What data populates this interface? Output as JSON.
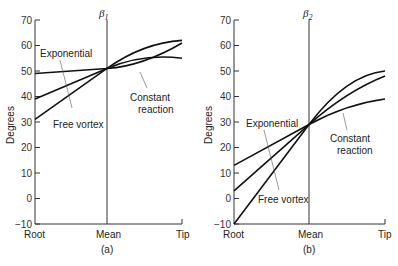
{
  "chart_data": [
    {
      "type": "line",
      "panel_label": "(a)",
      "title": "β1",
      "ylabel": "Degrees",
      "xlabel": "",
      "x": [
        "Root",
        "Mean",
        "Tip"
      ],
      "ylim": [
        -10,
        70
      ],
      "yticks": [
        -10,
        0,
        10,
        20,
        30,
        40,
        50,
        60,
        70
      ],
      "grid": false,
      "series": [
        {
          "name": "Exponential",
          "values": [
            49,
            51,
            61
          ]
        },
        {
          "name": "Free vortex",
          "values": [
            31,
            51,
            62
          ]
        },
        {
          "name": "Constant reaction",
          "values": [
            39,
            51,
            55
          ]
        }
      ],
      "annotations": [
        "Exponential",
        "Free vortex",
        "Constant reaction"
      ]
    },
    {
      "type": "line",
      "panel_label": "(b)",
      "title": "β2",
      "ylabel": "Degrees",
      "xlabel": "",
      "x": [
        "Root",
        "Mean",
        "Tip"
      ],
      "ylim": [
        -10,
        70
      ],
      "yticks": [
        -10,
        0,
        10,
        20,
        30,
        40,
        50,
        60,
        70
      ],
      "grid": false,
      "series": [
        {
          "name": "Exponential",
          "values": [
            3,
            29,
            48
          ]
        },
        {
          "name": "Free vortex",
          "values": [
            -10,
            29,
            50
          ]
        },
        {
          "name": "Constant reaction",
          "values": [
            13,
            29,
            39
          ]
        }
      ],
      "annotations": [
        "Exponential",
        "Free vortex",
        "Constant reaction"
      ]
    }
  ],
  "labels": {
    "a": {
      "beta_main": "β",
      "beta_sub": "1",
      "ylabel": "Degrees",
      "x_root": "Root",
      "x_mean": "Mean",
      "x_tip": "Tip",
      "panel": "(a)",
      "exponential": "Exponential",
      "free_vortex": "Free vortex",
      "constant_1": "Constant",
      "constant_2": "reaction"
    },
    "b": {
      "beta_main": "β",
      "beta_sub": "2",
      "ylabel": "Degrees",
      "x_root": "Root",
      "x_mean": "Mean",
      "x_tip": "Tip",
      "panel": "(b)",
      "exponential": "Exponential",
      "free_vortex": "Free vortex",
      "constant_1": "Constant",
      "constant_2": "reaction"
    }
  }
}
